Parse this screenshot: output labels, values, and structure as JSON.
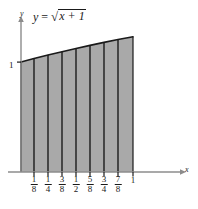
{
  "figure": {
    "name": "riemann-sum-diagram",
    "equation": {
      "lhs": "y",
      "relation": "=",
      "radicand": "x + 1",
      "radical_sign": "√",
      "full_text": "y = √(x + 1)"
    },
    "axes": {
      "x_letter": "x",
      "y_letter": "y",
      "y_tick_label": "1",
      "x_tick_labels": [
        {
          "num": "1",
          "den": "8",
          "is_fraction": true,
          "value": 0.125
        },
        {
          "num": "1",
          "den": "4",
          "is_fraction": true,
          "value": 0.25
        },
        {
          "num": "3",
          "den": "8",
          "is_fraction": true,
          "value": 0.375
        },
        {
          "num": "1",
          "den": "2",
          "is_fraction": true,
          "value": 0.5
        },
        {
          "num": "5",
          "den": "8",
          "is_fraction": true,
          "value": 0.625
        },
        {
          "num": "3",
          "den": "4",
          "is_fraction": true,
          "value": 0.75
        },
        {
          "num": "7",
          "den": "8",
          "is_fraction": true,
          "value": 0.875
        },
        {
          "num": "1",
          "den": "",
          "is_fraction": false,
          "value": 1.0
        }
      ]
    },
    "colors": {
      "fill": "#a9a9a9",
      "stroke": "#1a1a1a",
      "axis": "#8c8c8c",
      "background": "#ffffff"
    }
  },
  "chart_data": {
    "type": "area",
    "xlabel": "x",
    "ylabel": "y",
    "xlim": [
      0,
      1
    ],
    "ylim": [
      0,
      1.4142
    ],
    "grid": false,
    "legend": null,
    "function": "sqrt(x + 1)",
    "subdivisions": 8,
    "partition_x": [
      0,
      0.125,
      0.25,
      0.375,
      0.5,
      0.625,
      0.75,
      0.875,
      1.0
    ],
    "curve_points": [
      {
        "x": 0.0,
        "y": 1.0
      },
      {
        "x": 0.125,
        "y": 1.0607
      },
      {
        "x": 0.25,
        "y": 1.118
      },
      {
        "x": 0.375,
        "y": 1.1726
      },
      {
        "x": 0.5,
        "y": 1.2247
      },
      {
        "x": 0.625,
        "y": 1.2748
      },
      {
        "x": 0.75,
        "y": 1.3229
      },
      {
        "x": 0.875,
        "y": 1.3693
      },
      {
        "x": 1.0,
        "y": 1.4142
      }
    ],
    "y_tick_values": [
      1
    ],
    "x_tick_values": [
      0.125,
      0.25,
      0.375,
      0.5,
      0.625,
      0.75,
      0.875,
      1.0
    ],
    "x_tick_labels": [
      "1/8",
      "1/4",
      "3/8",
      "1/2",
      "5/8",
      "3/4",
      "7/8",
      "1"
    ],
    "shaded_region": "area under curve from x=0 to x=1 divided into 8 vertical strips"
  }
}
